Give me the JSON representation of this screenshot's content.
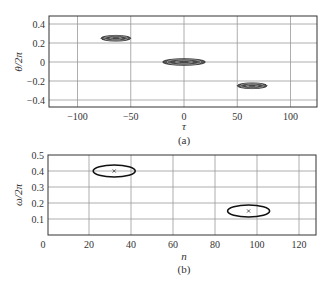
{
  "chart_data": [
    {
      "panel": "(a)",
      "type": "heatmap",
      "subtype": "contour",
      "title": "",
      "caption": "(a)",
      "xlabel": "τ",
      "ylabel": "θ/2π",
      "xlim": [
        -125,
        125
      ],
      "ylim": [
        -0.48,
        0.48
      ],
      "xticks": [
        -100,
        -50,
        0,
        50,
        100
      ],
      "xtick_labels": [
        "−100",
        "−50",
        "0",
        "50",
        "100"
      ],
      "yticks": [
        0.4,
        0.2,
        0,
        -0.2,
        -0.4
      ],
      "ytick_labels": [
        "0.4",
        "0.2",
        "0",
        "−0.2",
        "−0.4"
      ],
      "grid": true,
      "blobs": [
        {
          "tau": -64,
          "theta": 0.25,
          "tau_halfwidth": 14,
          "theta_halfwidth": 0.03
        },
        {
          "tau": 0,
          "theta": 0,
          "tau_halfwidth": 20,
          "theta_halfwidth": 0.035
        },
        {
          "tau": 64,
          "theta": -0.25,
          "tau_halfwidth": 14,
          "theta_halfwidth": 0.03
        }
      ]
    },
    {
      "panel": "(b)",
      "type": "scatter",
      "title": "",
      "caption": "(b)",
      "xlabel": "n",
      "ylabel": "ω/2π",
      "xlim": [
        0,
        128
      ],
      "ylim": [
        0,
        0.5
      ],
      "xticks": [
        0,
        20,
        40,
        60,
        80,
        100,
        120
      ],
      "xtick_labels": [
        "0",
        "20",
        "40",
        "60",
        "80",
        "100",
        "120"
      ],
      "yticks": [
        0.5,
        0.4,
        0.3,
        0.2,
        0.1
      ],
      "ytick_labels": [
        "0.5",
        "0.4",
        "0.3",
        "0.2",
        "0.1"
      ],
      "grid": true,
      "points": [
        {
          "n": 32,
          "omega": 0.4,
          "marker": "x",
          "ellipse_n_halfwidth": 10,
          "ellipse_omega_halfwidth": 0.025
        },
        {
          "n": 96,
          "omega": 0.15,
          "marker": "x",
          "ellipse_n_halfwidth": 10,
          "ellipse_omega_halfwidth": 0.025
        }
      ]
    }
  ],
  "labels": {
    "a_xlabel": "τ",
    "a_ylabel": "θ/2π",
    "a_caption": "(a)",
    "b_xlabel": "n",
    "b_ylabel": "ω/2π",
    "b_caption": "(b)",
    "b_origin": "0"
  }
}
